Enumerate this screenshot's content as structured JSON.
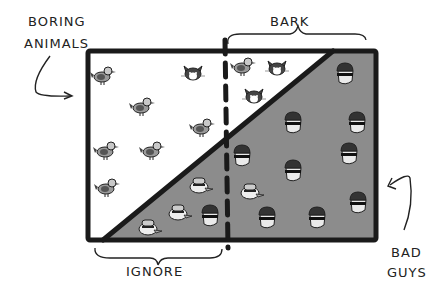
{
  "diagram": {
    "labels": {
      "boring_animals_line1": "BORING",
      "boring_animals_line2": "ANIMALS",
      "bark": "BARK",
      "ignore": "IGNORE",
      "bad_guys_line1": "BAD",
      "bad_guys_line2": "GUYS"
    },
    "regions": {
      "upper_left": "boring animals (ducks, cats)",
      "lower_right": "bad guys (burglars)",
      "left_of_dashed": "ignore",
      "right_of_dashed": "bark"
    },
    "colors": {
      "background": "#ffffff",
      "bad_guys_fill": "#8c8c8c",
      "outline": "#1a1a1a"
    },
    "icons": {
      "ducks": [
        [
          102,
          75
        ],
        [
          141,
          106
        ],
        [
          201,
          127
        ],
        [
          105,
          150
        ],
        [
          151,
          150
        ],
        [
          106,
          187
        ],
        [
          242,
          66
        ]
      ],
      "cats": [
        [
          193,
          73
        ],
        [
          277,
          68
        ],
        [
          254,
          96
        ]
      ],
      "burglars": [
        [
          345,
          72
        ],
        [
          242,
          155
        ],
        [
          294,
          123
        ],
        [
          361,
          124
        ],
        [
          353,
          155
        ],
        [
          294,
          170
        ],
        [
          263,
          220
        ],
        [
          323,
          214
        ],
        [
          360,
          203
        ],
        [
          208,
          217
        ],
        [
          178,
          213
        ]
      ],
      "disguised_cats": [
        [
          204,
          186
        ],
        [
          253,
          187
        ],
        [
          150,
          227
        ],
        [
          182,
          213
        ]
      ]
    }
  }
}
